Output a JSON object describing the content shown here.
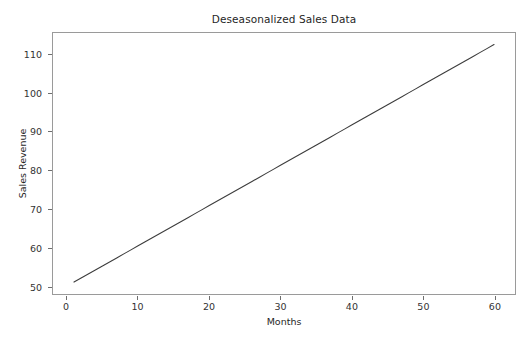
{
  "chart_data": {
    "type": "line",
    "title": "Deseasonalized Sales Data",
    "xlabel": "Months",
    "ylabel": "Sales Revenue",
    "xlim": [
      -1.95,
      62.95
    ],
    "ylim": [
      47.9,
      115.6
    ],
    "xticks": [
      0,
      10,
      20,
      30,
      40,
      50,
      60
    ],
    "xticklabels": [
      "0",
      "10",
      "20",
      "30",
      "40",
      "50",
      "60"
    ],
    "yticks": [
      50,
      60,
      70,
      80,
      90,
      100,
      110
    ],
    "yticklabels": [
      "50",
      "60",
      "70",
      "80",
      "90",
      "100",
      "110"
    ],
    "grid": false,
    "legend": null,
    "series": [
      {
        "name": "Deseasonalized sales revenue",
        "color": "#3d3d3d",
        "linewidth": 1.1,
        "x": [
          1,
          2,
          3,
          4,
          5,
          6,
          7,
          8,
          9,
          10,
          11,
          12,
          13,
          14,
          15,
          16,
          17,
          18,
          19,
          20,
          21,
          22,
          23,
          24,
          25,
          26,
          27,
          28,
          29,
          30,
          31,
          32,
          33,
          34,
          35,
          36,
          37,
          38,
          39,
          40,
          41,
          42,
          43,
          44,
          45,
          46,
          47,
          48,
          49,
          50,
          51,
          52,
          53,
          54,
          55,
          56,
          57,
          58,
          59,
          60
        ],
        "y": [
          51.0,
          52.04,
          53.09,
          54.13,
          55.17,
          56.22,
          57.26,
          58.31,
          59.35,
          60.39,
          61.44,
          62.48,
          63.53,
          64.57,
          65.61,
          66.66,
          67.7,
          68.75,
          69.79,
          70.83,
          71.88,
          72.92,
          73.97,
          75.01,
          76.05,
          77.1,
          78.14,
          79.19,
          80.23,
          81.27,
          82.32,
          83.36,
          84.41,
          85.45,
          86.49,
          87.54,
          88.58,
          89.63,
          90.67,
          91.71,
          92.76,
          93.8,
          94.85,
          95.89,
          96.93,
          97.98,
          99.02,
          100.07,
          101.11,
          102.15,
          103.2,
          104.24,
          105.29,
          106.33,
          107.37,
          108.42,
          109.46,
          110.51,
          111.55,
          112.59
        ]
      }
    ]
  },
  "style": {
    "background": "#ffffff",
    "axes_edge_color": "#9a9a9a",
    "tick_color": "#6e6e6e",
    "text_color": "#272727"
  }
}
